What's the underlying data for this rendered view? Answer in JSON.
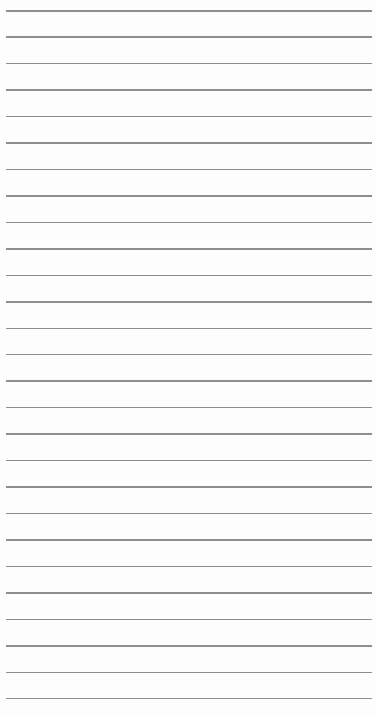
{
  "paper": {
    "type": "lined-paper",
    "background_color": "#fdfdfd",
    "line_color": "#7a7a7a",
    "line_count": 27,
    "first_line_y": 10,
    "line_spacing": 26.46,
    "line_left": 6,
    "line_right": 372
  }
}
